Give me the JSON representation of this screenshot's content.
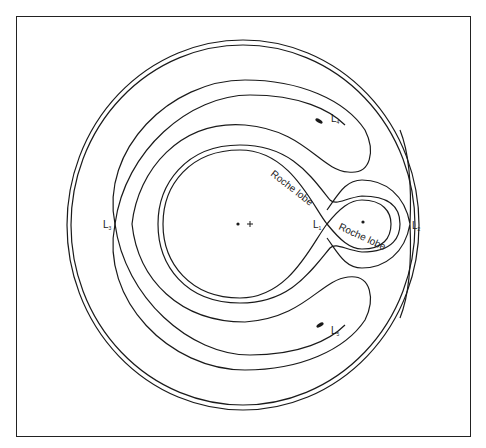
{
  "figure": {
    "labels": {
      "roche_lobe_primary": "Roche lobe",
      "roche_lobe_secondary": "Roche lobe",
      "l1": {
        "main": "L",
        "sub": "1"
      },
      "l2": {
        "main": "L",
        "sub": "2"
      },
      "l3": {
        "main": "L",
        "sub": "3"
      },
      "l4": {
        "main": "L",
        "sub": "4"
      },
      "l5": {
        "main": "L",
        "sub": "5"
      }
    },
    "markers": {
      "primary_star": "dot",
      "center_of_mass": "+",
      "secondary_star": "dot"
    },
    "colors": {
      "stroke": "#1a1a1a",
      "background": "#ffffff",
      "frame": "#222222"
    }
  }
}
